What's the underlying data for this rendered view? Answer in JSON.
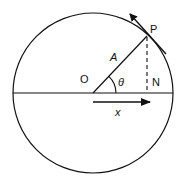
{
  "diagram": {
    "labels": {
      "point_p": "P",
      "origin": "O",
      "foot_n": "N",
      "amplitude": "A",
      "angle": "θ",
      "displacement": "x"
    },
    "geometry": {
      "center": [
        93,
        93
      ],
      "radius": 80,
      "point_p": [
        147,
        36
      ],
      "foot_n": [
        147,
        93
      ]
    },
    "colors": {
      "stroke": "#111111",
      "background": "#ffffff"
    }
  }
}
